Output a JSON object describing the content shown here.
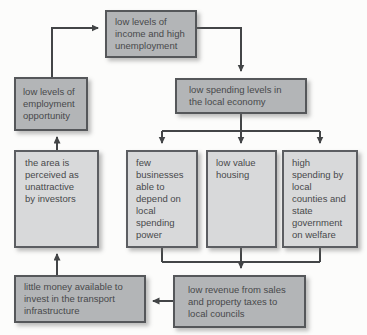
{
  "diagram": {
    "type": "flowchart-cycle",
    "nodes": [
      {
        "id": "income",
        "label": "low levels of\nincome and high\nunemployment"
      },
      {
        "id": "employment",
        "label": "low levels of\nemployment\nopportunity"
      },
      {
        "id": "spending",
        "label": "low spending levels in\nthe local economy"
      },
      {
        "id": "area",
        "label": "the area is\nperceived as\nunattractive\nby investors"
      },
      {
        "id": "few",
        "label": "few\nbusinesses\nable to\ndepend on\nlocal\nspending\npower"
      },
      {
        "id": "housing",
        "label": "low value\nhousing"
      },
      {
        "id": "welfare",
        "label": "high\nspending by\nlocal\ncounties and\nstate\ngovernment\non welfare"
      },
      {
        "id": "transport",
        "label": "little money available to\ninvest in the transport\ninfrastructure"
      },
      {
        "id": "revenue",
        "label": "low revenue from sales\nand property taxes to\nlocal councils"
      }
    ],
    "edges": [
      {
        "from": "employment",
        "to": "income"
      },
      {
        "from": "income",
        "to": "spending"
      },
      {
        "from": "spending",
        "to": "few"
      },
      {
        "from": "spending",
        "to": "housing"
      },
      {
        "from": "spending",
        "to": "welfare"
      },
      {
        "from": "few",
        "to": "revenue"
      },
      {
        "from": "housing",
        "to": "revenue"
      },
      {
        "from": "welfare",
        "to": "revenue"
      },
      {
        "from": "revenue",
        "to": "transport"
      },
      {
        "from": "transport",
        "to": "area"
      },
      {
        "from": "area",
        "to": "employment"
      }
    ],
    "colors": {
      "box_dark_fill": "#b3b5b7",
      "box_light_fill": "#d8d9da",
      "box_border": "#55575a",
      "arrow": "#434547",
      "text": "#48494b",
      "background": "#fcfcfb"
    }
  }
}
